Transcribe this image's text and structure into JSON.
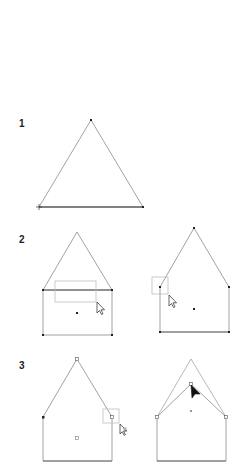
{
  "steps": [
    {
      "label": "1",
      "description": "Triangle with three anchor points"
    },
    {
      "label": "2",
      "description": "Rectangle added below triangle; marquee selection, then dragging anchor points"
    },
    {
      "label": "3",
      "description": "Direct selection of anchor point and moving a point inward"
    }
  ],
  "colors": {
    "stroke": "#8a8a8a",
    "anchor": "#222222",
    "selection": "#bdbdbd",
    "cursor": "#111111"
  }
}
